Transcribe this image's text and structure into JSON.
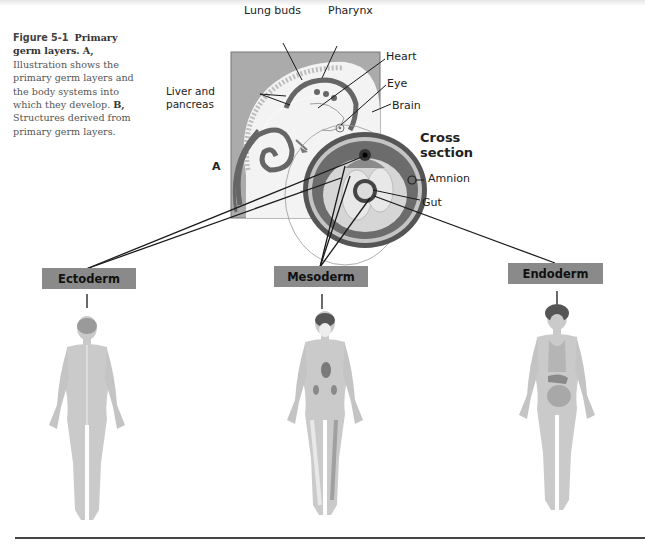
{
  "caption": {
    "figure_label": "Figure 5-1",
    "title": "Primary germ layers.",
    "part_a_label": "A,",
    "part_a_text": "Illustration shows the primary germ layers and the body systems into which they develop.",
    "part_b_label": "B,",
    "part_b_text": "Structures derived from primary germ layers."
  },
  "embryo": {
    "panel_label": "A",
    "labels": {
      "lung_buds": "Lung buds",
      "pharynx": "Pharynx",
      "heart": "Heart",
      "eye": "Eye",
      "brain": "Brain",
      "liver_pancreas_line1": "Liver and",
      "liver_pancreas_line2": "pancreas",
      "cross_section_line1": "Cross",
      "cross_section_line2": "section",
      "amnion": "Amnion",
      "gut": "Gut"
    }
  },
  "germ_layers": [
    {
      "name": "Ectoderm"
    },
    {
      "name": "Mesoderm"
    },
    {
      "name": "Endoderm"
    }
  ],
  "colors": {
    "layer_box": "#8a8a8a",
    "panel_bg": "#a9a9a9",
    "body_fill": "#c8c8c8",
    "line": "#1a1a1a"
  }
}
